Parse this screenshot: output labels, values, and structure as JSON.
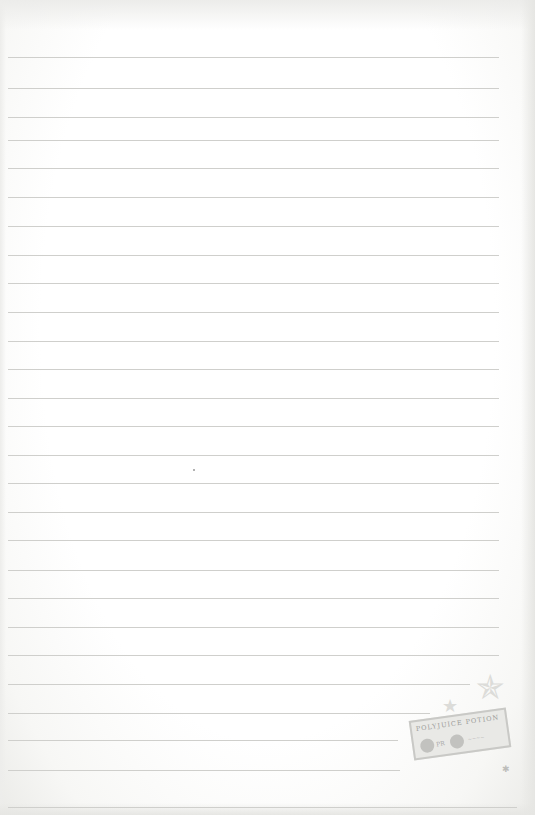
{
  "page": {
    "type": "lined-notepaper",
    "background_color": "#ffffff",
    "rule_color": "#cfcfcc",
    "rules": [
      {
        "y": 57,
        "x_end": 499
      },
      {
        "y": 88,
        "x_end": 499
      },
      {
        "y": 117,
        "x_end": 499
      },
      {
        "y": 140,
        "x_end": 499
      },
      {
        "y": 168,
        "x_end": 499
      },
      {
        "y": 197,
        "x_end": 499
      },
      {
        "y": 226,
        "x_end": 499
      },
      {
        "y": 255,
        "x_end": 499
      },
      {
        "y": 283,
        "x_end": 499
      },
      {
        "y": 312,
        "x_end": 499
      },
      {
        "y": 341,
        "x_end": 499
      },
      {
        "y": 369,
        "x_end": 499
      },
      {
        "y": 398,
        "x_end": 499
      },
      {
        "y": 426,
        "x_end": 499
      },
      {
        "y": 455,
        "x_end": 499
      },
      {
        "y": 483,
        "x_end": 499
      },
      {
        "y": 512,
        "x_end": 499
      },
      {
        "y": 540,
        "x_end": 499
      },
      {
        "y": 570,
        "x_end": 499
      },
      {
        "y": 598,
        "x_end": 499
      },
      {
        "y": 627,
        "x_end": 499
      },
      {
        "y": 655,
        "x_end": 499
      },
      {
        "y": 684,
        "x_end": 470
      },
      {
        "y": 713,
        "x_end": 430
      },
      {
        "y": 740,
        "x_end": 398
      },
      {
        "y": 770,
        "x_end": 400
      },
      {
        "y": 807,
        "x_end": 517
      }
    ]
  },
  "decorations": {
    "stamp_label": "POLYJUICE POTION",
    "stamp_seal_text": "PR",
    "stamp_fine_text": "~~~~",
    "star_large": "✯",
    "star_small": "★",
    "star_tiny": "✱"
  }
}
